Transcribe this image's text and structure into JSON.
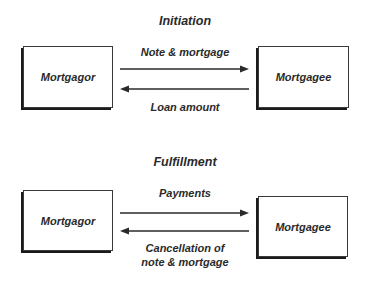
{
  "diagram": {
    "sections": [
      {
        "title": "Initiation",
        "left_party": "Mortgagor",
        "right_party": "Mortgagee",
        "flows": [
          {
            "direction": "right",
            "label": "Note & mortgage"
          },
          {
            "direction": "left",
            "label": "Loan amount"
          }
        ]
      },
      {
        "title": "Fulfillment",
        "left_party": "Mortgagor",
        "right_party": "Mortgagee",
        "flows": [
          {
            "direction": "right",
            "label": "Payments"
          },
          {
            "direction": "left",
            "label_line1": "Cancellation of",
            "label_line2": "note & mortgage"
          }
        ]
      }
    ],
    "colors": {
      "stroke": "#2a2a2a",
      "background": "#ffffff"
    }
  }
}
